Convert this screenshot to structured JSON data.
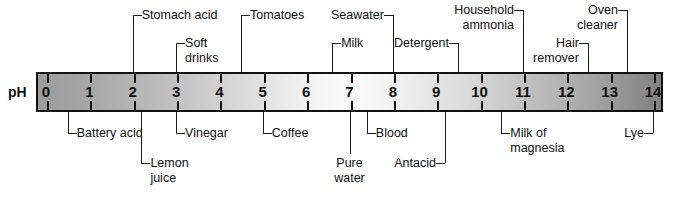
{
  "diagram": {
    "axis_label": "pH",
    "scale": {
      "min": 0,
      "max": 14,
      "ticks": [
        "0",
        "1",
        "2",
        "3",
        "4",
        "5",
        "6",
        "7",
        "8",
        "9",
        "10",
        "11",
        "12",
        "13",
        "14"
      ],
      "gradient_left_color": "#9c9c9c",
      "gradient_center_color": "#fbfbfb",
      "gradient_right_color": "#828282",
      "border_color": "#111111"
    },
    "labels_above": [
      {
        "text": "Stomach acid",
        "ph": 2.0,
        "attach": "left"
      },
      {
        "text": "Soft\ndrinks",
        "ph": 3.0,
        "attach": "left"
      },
      {
        "text": "Tomatoes",
        "ph": 4.5,
        "attach": "left"
      },
      {
        "text": "Seawater",
        "ph": 8.0,
        "attach": "right"
      },
      {
        "text": "Milk",
        "ph": 6.6,
        "attach": "left"
      },
      {
        "text": "Detergent",
        "ph": 9.5,
        "attach": "right"
      },
      {
        "text": "Household\nammonia",
        "ph": 11.0,
        "attach": "right"
      },
      {
        "text": "Hair\nremover",
        "ph": 12.5,
        "attach": "right"
      },
      {
        "text": "Oven\ncleaner",
        "ph": 13.4,
        "attach": "right"
      }
    ],
    "labels_below": [
      {
        "text": "Battery acid",
        "ph": 0.5,
        "attach": "left"
      },
      {
        "text": "Lemon\njuice",
        "ph": 2.2,
        "attach": "left"
      },
      {
        "text": "Vinegar",
        "ph": 3.0,
        "attach": "left"
      },
      {
        "text": "Coffee",
        "ph": 5.0,
        "attach": "left"
      },
      {
        "text": "Pure\nwater",
        "ph": 7.0,
        "attach": "straight"
      },
      {
        "text": "Blood",
        "ph": 7.4,
        "attach": "left"
      },
      {
        "text": "Antacid",
        "ph": 9.2,
        "attach": "right"
      },
      {
        "text": "Milk of\nmagnesia",
        "ph": 10.5,
        "attach": "left"
      },
      {
        "text": "Lye",
        "ph": 14.0,
        "attach": "right"
      }
    ]
  }
}
